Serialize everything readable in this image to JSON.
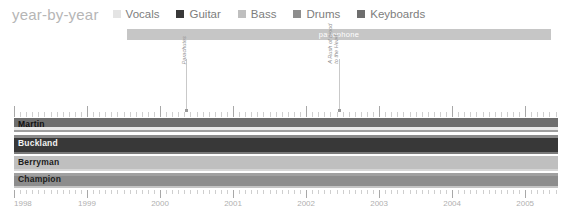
{
  "header": {
    "title": "year-by-year"
  },
  "legend": {
    "items": [
      {
        "label": "Vocals",
        "color": "#e4e4e4"
      },
      {
        "label": "Guitar",
        "color": "#383838"
      },
      {
        "label": "Bass",
        "color": "#bfbfbf"
      },
      {
        "label": "Drums",
        "color": "#8d8d8d"
      },
      {
        "label": "Keyboards",
        "color": "#6e6e6e"
      }
    ]
  },
  "banners": [
    {
      "label": "parlophone",
      "start": 1999.55,
      "end": 2005.35,
      "color": "#c6c6c6"
    }
  ],
  "annotations": [
    {
      "label": "Parachutes",
      "lines": [
        "Parachutes"
      ],
      "year": 2000.35,
      "stem": 50
    },
    {
      "label": "A Rush of Blood to the Head",
      "lines": [
        "A Rush of Blood",
        "to the Head"
      ],
      "year": 2002.45,
      "stem": 50
    }
  ],
  "axis": {
    "min": 1998.0,
    "max": 2005.45,
    "ticks": [
      1998,
      1999,
      2000,
      2001,
      2002,
      2003,
      2004,
      2005
    ],
    "tick_labels": [
      "1998",
      "1999",
      "2000",
      "2001",
      "2002",
      "2003",
      "2004",
      "2005"
    ],
    "minor_per_year": 12
  },
  "chart_data": {
    "type": "bar",
    "title": "year-by-year",
    "xlabel": "",
    "ylabel": "",
    "xlim": [
      1998.0,
      2005.45
    ],
    "grid": false,
    "legend_position": "top",
    "categories": [
      "Martin",
      "Buckland",
      "Berryman",
      "Champion"
    ],
    "series": [
      {
        "name": "Vocals",
        "color": "#e4e4e4"
      },
      {
        "name": "Guitar",
        "color": "#383838"
      },
      {
        "name": "Bass",
        "color": "#bfbfbf"
      },
      {
        "name": "Drums",
        "color": "#8d8d8d"
      },
      {
        "name": "Keyboards",
        "color": "#6e6e6e"
      }
    ],
    "rows": [
      {
        "name": "Martin",
        "name_color": "#111111",
        "top": 0,
        "height": 16,
        "bars": [
          {
            "instrument": "Keyboards",
            "color": "#6e6e6e",
            "top": 0,
            "height": 9,
            "start": 1998.0,
            "end": 2005.45
          },
          {
            "instrument": "Vocals",
            "color": "#e9e9e9",
            "top": 9,
            "height": 2.5,
            "start": 1998.0,
            "end": 2005.45
          },
          {
            "instrument": "Guitar",
            "color": "#9f9f9f",
            "top": 11.5,
            "height": 2,
            "start": 1998.0,
            "end": 2005.45
          }
        ]
      },
      {
        "name": "Buckland",
        "name_color": "#f2f2f2",
        "top": 17,
        "height": 20,
        "bars": [
          {
            "instrument": "Guitar",
            "color": "#8b8b8b",
            "top": 0,
            "height": 3,
            "start": 1998.0,
            "end": 2005.45
          },
          {
            "instrument": "Guitar",
            "color": "#383838",
            "top": 3,
            "height": 14,
            "start": 1998.0,
            "end": 2005.45
          },
          {
            "instrument": "Keyboards",
            "color": "#7a7a7a",
            "top": 17,
            "height": 2,
            "start": 1998.0,
            "end": 2005.45
          }
        ]
      },
      {
        "name": "Berryman",
        "name_color": "#1d1d1d",
        "top": 38,
        "height": 16,
        "bars": [
          {
            "instrument": "Bass",
            "color": "#bfbfbf",
            "top": 0,
            "height": 13,
            "start": 1998.0,
            "end": 2005.45
          },
          {
            "instrument": "Keyboards",
            "color": "#d6d6d6",
            "top": 13,
            "height": 2,
            "start": 1998.0,
            "end": 2005.45
          }
        ]
      },
      {
        "name": "Champion",
        "name_color": "#1d1d1d",
        "top": 55,
        "height": 15,
        "bars": [
          {
            "instrument": "Drums",
            "color": "#a0a0a0",
            "top": 0,
            "height": 3,
            "start": 1998.0,
            "end": 2005.45
          },
          {
            "instrument": "Drums",
            "color": "#8d8d8d",
            "top": 3,
            "height": 10,
            "start": 1998.0,
            "end": 2005.45
          },
          {
            "instrument": "Vocals",
            "color": "#c4c4c4",
            "top": 13,
            "height": 2,
            "start": 1998.0,
            "end": 2005.45
          }
        ]
      }
    ]
  }
}
